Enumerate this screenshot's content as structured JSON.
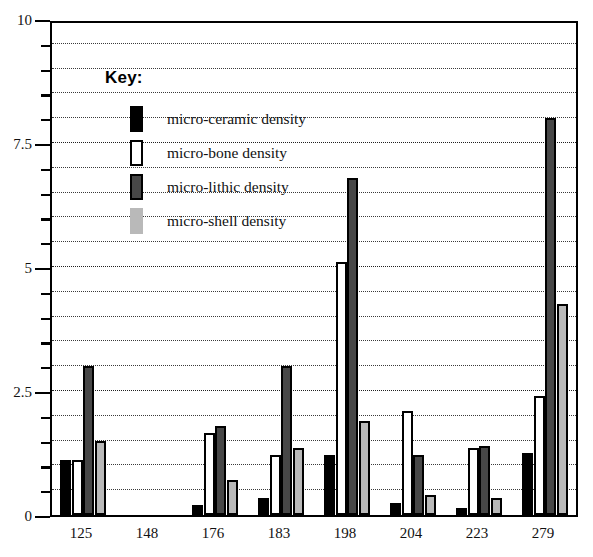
{
  "chart_data": {
    "type": "bar",
    "title": "",
    "xlabel": "",
    "ylabel": "",
    "ylim": [
      0,
      10
    ],
    "yticks": [
      0,
      2.5,
      5,
      7.5,
      10
    ],
    "ytick_labels": [
      "0",
      "2.5",
      "5",
      "7.5",
      "10"
    ],
    "minor_tick_step": 0.5,
    "grid": true,
    "grid_axis": "y",
    "legend_position": "upper-left-inside",
    "categories": [
      "125",
      "148",
      "176",
      "183",
      "198",
      "204",
      "223",
      "279"
    ],
    "series": [
      {
        "name": "micro-ceramic density",
        "color": "#000000",
        "values": [
          1.1,
          0.0,
          0.2,
          0.35,
          1.2,
          0.25,
          0.15,
          1.25
        ]
      },
      {
        "name": "micro-bone density",
        "color": "#ffffff",
        "values": [
          1.1,
          0.0,
          1.65,
          1.2,
          5.1,
          2.1,
          1.35,
          2.4
        ]
      },
      {
        "name": "micro-lithic density",
        "color": "#474747",
        "values": [
          3.0,
          0.0,
          1.8,
          3.0,
          6.8,
          1.2,
          1.4,
          8.0
        ]
      },
      {
        "name": "micro-shell density",
        "color": "#b9b9b9",
        "values": [
          1.5,
          0.0,
          0.7,
          1.35,
          1.9,
          0.4,
          0.35,
          4.25
        ]
      }
    ]
  },
  "legend": {
    "title": "Key:",
    "entries": [
      {
        "label": "micro-ceramic density",
        "swatch": "ceramic"
      },
      {
        "label": "micro-bone density",
        "swatch": "bone"
      },
      {
        "label": "micro-lithic density",
        "swatch": "lithic"
      },
      {
        "label": "micro-shell density",
        "swatch": "shell"
      }
    ]
  }
}
